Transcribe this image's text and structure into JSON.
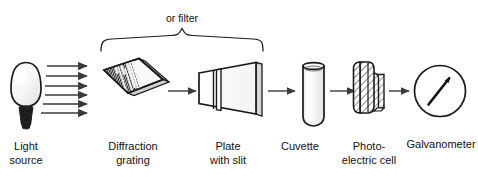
{
  "figure": {
    "title_text": "",
    "background_color": "#ffffff",
    "line_color": "#1a1a1a",
    "arrow_color": "#3a3a3a",
    "annotation": {
      "brace_label": "or filter"
    },
    "components": [
      {
        "id": "light-source",
        "label_line1": "Light",
        "label_line2": "source",
        "icon": "light-bulb-icon"
      },
      {
        "id": "diffraction-grating",
        "label_line1": "Diffraction",
        "label_line2": "grating",
        "icon": "diffraction-grating-icon"
      },
      {
        "id": "plate-with-slit",
        "label_line1": "Plate",
        "label_line2": "with slit",
        "icon": "slit-plate-icon"
      },
      {
        "id": "cuvette",
        "label_line1": "Cuvette",
        "label_line2": "",
        "icon": "cuvette-icon"
      },
      {
        "id": "photo-electric-cell",
        "label_line1": "Photo-",
        "label_line2": "electric cell",
        "icon": "photocell-icon"
      },
      {
        "id": "galvanometer",
        "label_line1": "Galvanometer",
        "label_line2": "",
        "icon": "galvanometer-dial-icon"
      }
    ],
    "ray_arrow_count": 6
  }
}
